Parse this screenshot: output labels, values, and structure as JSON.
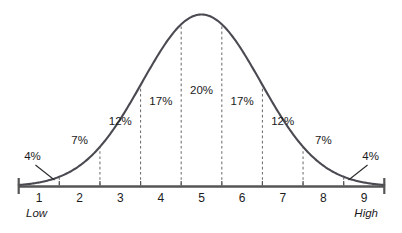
{
  "chart_data": {
    "type": "area",
    "title": "",
    "subtitle": "",
    "xlabel": "",
    "ylabel": "",
    "grid": false,
    "legend_position": "none",
    "curve_kind": "normal-distribution-bell-curve",
    "xlim": [
      0.5,
      9.5
    ],
    "ylim": [
      0,
      1
    ],
    "x_axis": {
      "tick_labels": [
        "1",
        "2",
        "3",
        "4",
        "5",
        "6",
        "7",
        "8",
        "9"
      ],
      "tick_values": [
        1,
        2,
        3,
        4,
        5,
        6,
        7,
        8,
        9
      ],
      "low_end_label": "Low",
      "high_end_label": "High"
    },
    "categories": [
      "1",
      "2",
      "3",
      "4",
      "5",
      "6",
      "7",
      "8",
      "9"
    ],
    "values": [
      4,
      7,
      12,
      17,
      20,
      17,
      12,
      7,
      4
    ],
    "value_labels": [
      "4%",
      "7%",
      "12%",
      "17%",
      "20%",
      "17%",
      "12%",
      "7%",
      "4%"
    ],
    "segments": [
      {
        "category": "1",
        "label": "4%",
        "value": 4,
        "x_center": 1,
        "boundary_left": 0.5,
        "boundary_right": 1.5,
        "callout": true,
        "callout_side": "left"
      },
      {
        "category": "2",
        "label": "7%",
        "value": 7,
        "x_center": 2,
        "boundary_left": 1.5,
        "boundary_right": 2.5,
        "callout": false,
        "callout_side": ""
      },
      {
        "category": "3",
        "label": "12%",
        "value": 12,
        "x_center": 3,
        "boundary_left": 2.5,
        "boundary_right": 3.5,
        "callout": false,
        "callout_side": ""
      },
      {
        "category": "4",
        "label": "17%",
        "value": 17,
        "x_center": 4,
        "boundary_left": 3.5,
        "boundary_right": 4.5,
        "callout": false,
        "callout_side": ""
      },
      {
        "category": "5",
        "label": "20%",
        "value": 20,
        "x_center": 5,
        "boundary_left": 4.5,
        "boundary_right": 5.5,
        "callout": false,
        "callout_side": ""
      },
      {
        "category": "6",
        "label": "17%",
        "value": 17,
        "x_center": 6,
        "boundary_left": 5.5,
        "boundary_right": 6.5,
        "callout": false,
        "callout_side": ""
      },
      {
        "category": "7",
        "label": "12%",
        "value": 12,
        "x_center": 7,
        "boundary_left": 6.5,
        "boundary_right": 7.5,
        "callout": false,
        "callout_side": ""
      },
      {
        "category": "8",
        "label": "7%",
        "value": 7,
        "x_center": 8,
        "boundary_left": 7.5,
        "boundary_right": 8.5,
        "callout": false,
        "callout_side": ""
      },
      {
        "category": "9",
        "label": "4%",
        "value": 4,
        "x_center": 9,
        "boundary_left": 8.5,
        "boundary_right": 9.5,
        "callout": true,
        "callout_side": "right"
      }
    ],
    "divider_positions": [
      1.5,
      2.5,
      3.5,
      4.5,
      5.5,
      6.5,
      7.5,
      8.5
    ],
    "total_percent": "100%",
    "colors": {
      "curve": "#4a4a52",
      "axis": "#555555",
      "divider": "#6e6e6e",
      "callout": "#2b2b2b",
      "text": "#1b1b1b",
      "background": "#ffffff"
    }
  }
}
